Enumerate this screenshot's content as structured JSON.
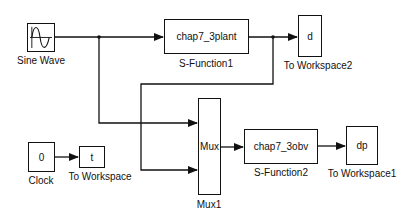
{
  "blocks": {
    "sine_wave": {
      "label": "Sine Wave",
      "content": ""
    },
    "plant": {
      "label": "S-Function1",
      "content": "chap7_3plant"
    },
    "to_ws2": {
      "label": "To Workspace2",
      "content": "d"
    },
    "clock": {
      "label": "Clock",
      "content": "0"
    },
    "to_ws": {
      "label": "To Workspace",
      "content": "t"
    },
    "mux": {
      "label": "Mux1",
      "content": "Mux"
    },
    "observer": {
      "label": "S-Function2",
      "content": "chap7_3obv"
    },
    "to_ws1": {
      "label": "To Workspace1",
      "content": "dp"
    }
  },
  "colors": {
    "line": "#111111",
    "background": "#ffffff"
  }
}
